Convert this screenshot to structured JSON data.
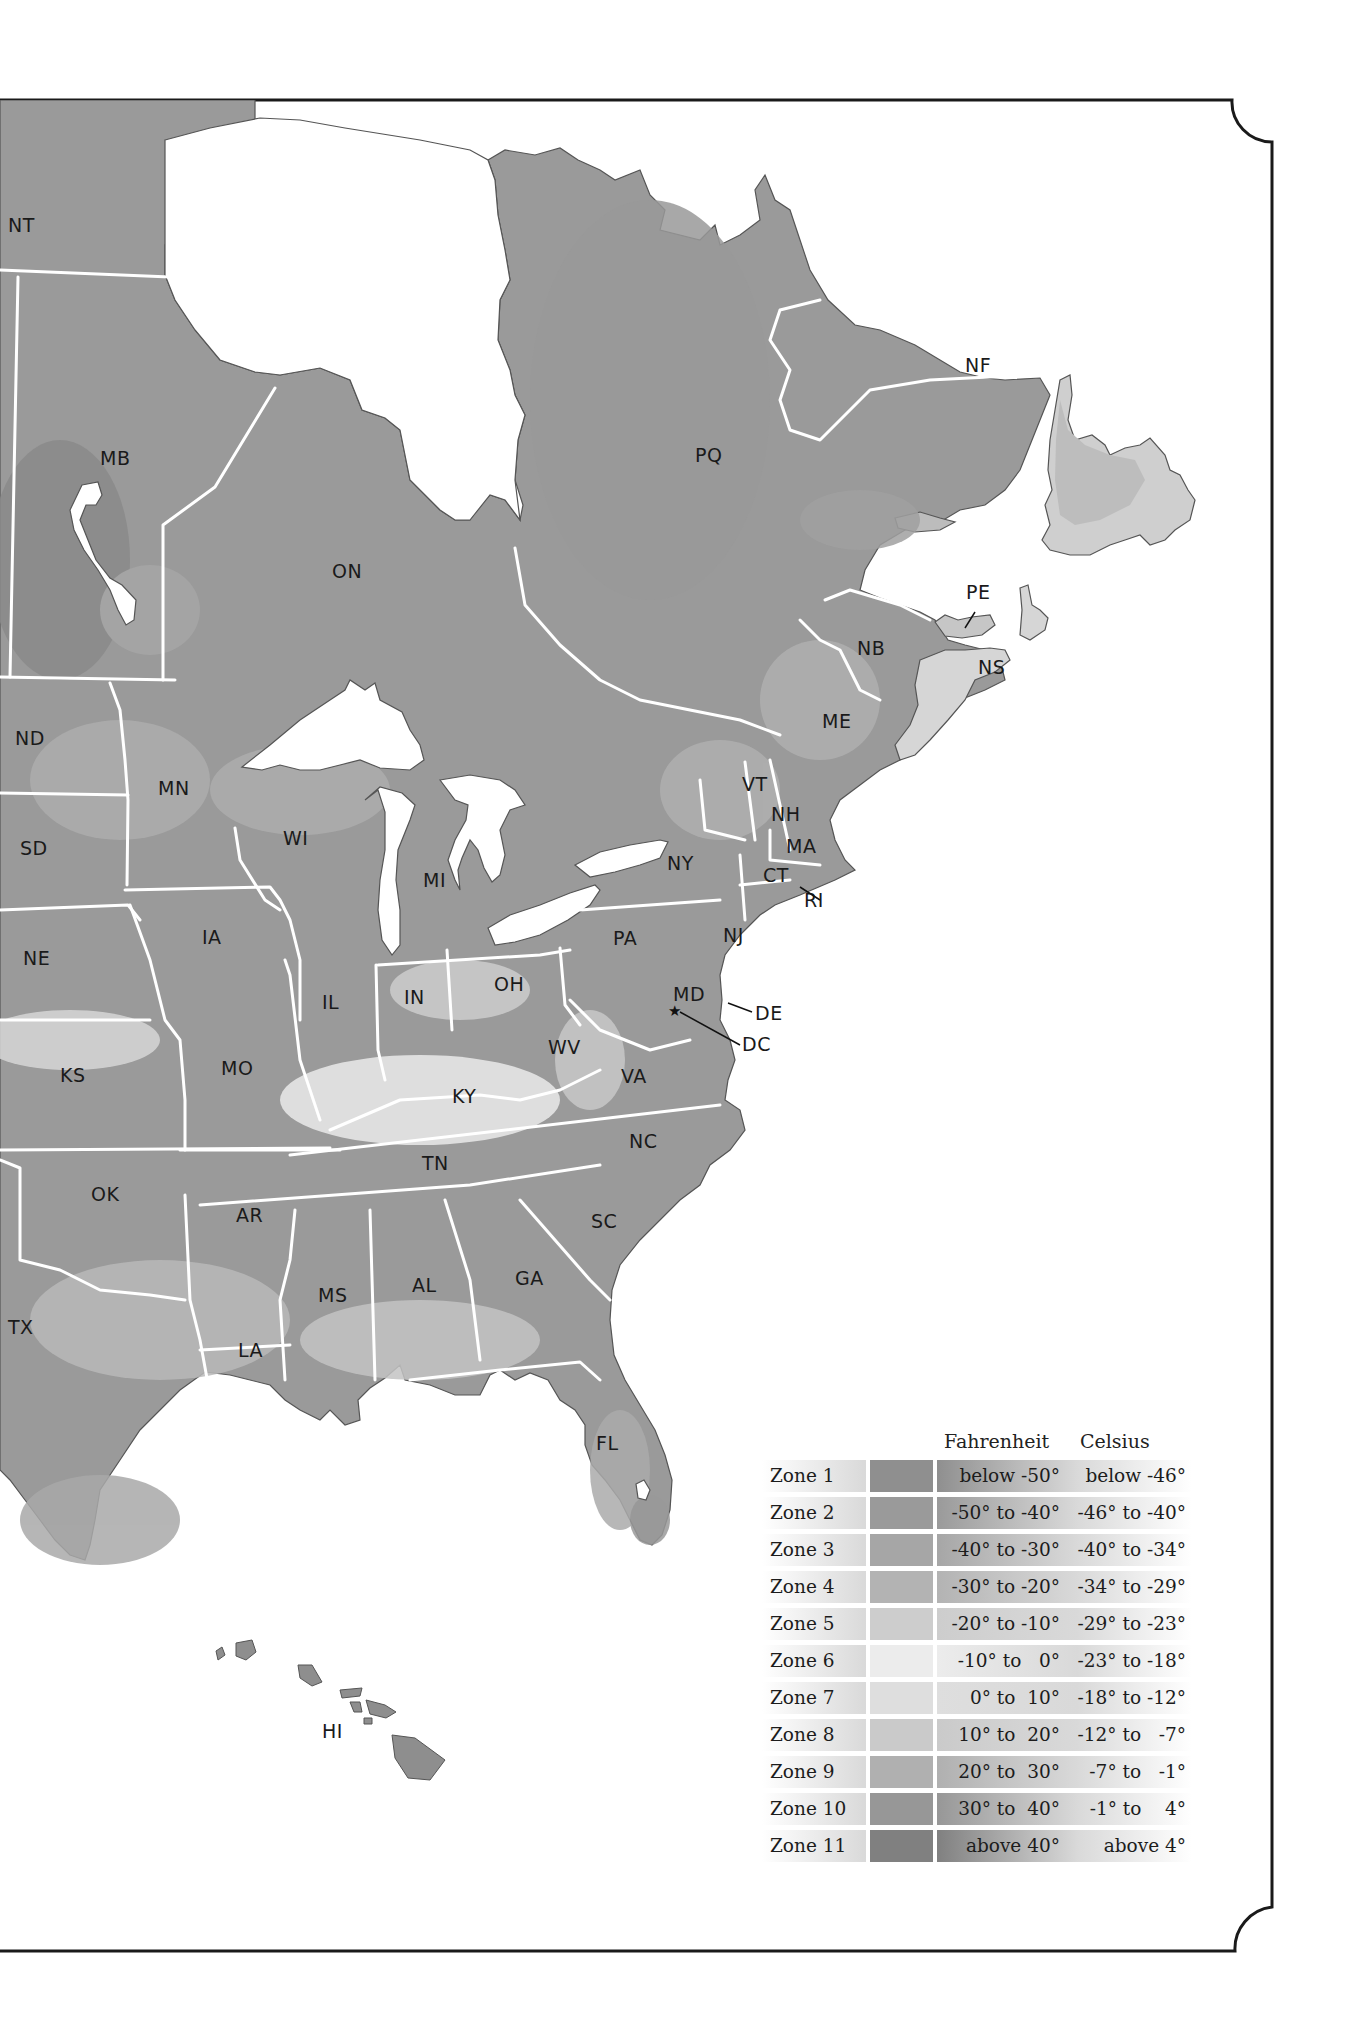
{
  "map": {
    "title": "Plant Hardiness Zones — Eastern North America",
    "canada_labels": [
      {
        "code": "NT",
        "x": 8,
        "y": 232
      },
      {
        "code": "MB",
        "x": 100,
        "y": 465
      },
      {
        "code": "ON",
        "x": 332,
        "y": 578
      },
      {
        "code": "PQ",
        "x": 695,
        "y": 462
      },
      {
        "code": "NF",
        "x": 965,
        "y": 372
      },
      {
        "code": "PE",
        "x": 966,
        "y": 599
      },
      {
        "code": "NB",
        "x": 857,
        "y": 655
      },
      {
        "code": "NS",
        "x": 978,
        "y": 674
      },
      {
        "code": "ME",
        "x": 822,
        "y": 728
      }
    ],
    "us_labels": [
      {
        "code": "ND",
        "x": 15,
        "y": 745
      },
      {
        "code": "MN",
        "x": 158,
        "y": 795
      },
      {
        "code": "WI",
        "x": 283,
        "y": 845
      },
      {
        "code": "SD",
        "x": 20,
        "y": 855
      },
      {
        "code": "MI",
        "x": 423,
        "y": 887
      },
      {
        "code": "VT",
        "x": 742,
        "y": 791
      },
      {
        "code": "NH",
        "x": 771,
        "y": 821
      },
      {
        "code": "MA",
        "x": 786,
        "y": 853
      },
      {
        "code": "NY",
        "x": 667,
        "y": 870
      },
      {
        "code": "CT",
        "x": 763,
        "y": 882
      },
      {
        "code": "RI",
        "x": 804,
        "y": 907
      },
      {
        "code": "NE",
        "x": 23,
        "y": 965
      },
      {
        "code": "IA",
        "x": 202,
        "y": 944
      },
      {
        "code": "PA",
        "x": 613,
        "y": 945
      },
      {
        "code": "NJ",
        "x": 723,
        "y": 942
      },
      {
        "code": "IL",
        "x": 322,
        "y": 1009
      },
      {
        "code": "IN",
        "x": 404,
        "y": 1004
      },
      {
        "code": "OH",
        "x": 494,
        "y": 991
      },
      {
        "code": "MD",
        "x": 673,
        "y": 1001
      },
      {
        "code": "DE",
        "x": 755,
        "y": 1020
      },
      {
        "code": "DC",
        "x": 742,
        "y": 1051
      },
      {
        "code": "WV",
        "x": 548,
        "y": 1054
      },
      {
        "code": "KS",
        "x": 60,
        "y": 1082
      },
      {
        "code": "MO",
        "x": 221,
        "y": 1075
      },
      {
        "code": "VA",
        "x": 621,
        "y": 1083
      },
      {
        "code": "KY",
        "x": 452,
        "y": 1103
      },
      {
        "code": "NC",
        "x": 629,
        "y": 1148
      },
      {
        "code": "TN",
        "x": 422,
        "y": 1170
      },
      {
        "code": "OK",
        "x": 91,
        "y": 1201
      },
      {
        "code": "AR",
        "x": 236,
        "y": 1222
      },
      {
        "code": "SC",
        "x": 591,
        "y": 1228
      },
      {
        "code": "GA",
        "x": 515,
        "y": 1285
      },
      {
        "code": "AL",
        "x": 412,
        "y": 1292
      },
      {
        "code": "MS",
        "x": 318,
        "y": 1302
      },
      {
        "code": "TX",
        "x": 8,
        "y": 1334
      },
      {
        "code": "LA",
        "x": 238,
        "y": 1357
      },
      {
        "code": "FL",
        "x": 596,
        "y": 1450
      },
      {
        "code": "HI",
        "x": 322,
        "y": 1738
      }
    ],
    "capital_marker": {
      "icon": "star-icon",
      "glyph": "★",
      "label": "DC"
    }
  },
  "legend": {
    "header_fahrenheit": "Fahrenheit",
    "header_celsius": "Celsius",
    "zones": [
      {
        "zone": "Zone 1",
        "fahrenheit": "below -50°",
        "celsius": "below -46°",
        "color": "#8f8f8f"
      },
      {
        "zone": "Zone 2",
        "fahrenheit": "-50° to -40°",
        "celsius": "-46° to -40°",
        "color": "#9a9a9a"
      },
      {
        "zone": "Zone 3",
        "fahrenheit": "-40° to -30°",
        "celsius": "-40° to -34°",
        "color": "#a6a6a6"
      },
      {
        "zone": "Zone 4",
        "fahrenheit": "-30° to -20°",
        "celsius": "-34° to -29°",
        "color": "#b3b3b3"
      },
      {
        "zone": "Zone 5",
        "fahrenheit": "-20° to -10°",
        "celsius": "-29° to -23°",
        "color": "#cdcdcd"
      },
      {
        "zone": "Zone 6",
        "fahrenheit": "-10° to   0°",
        "celsius": "-23° to -18°",
        "color": "#ececec"
      },
      {
        "zone": "Zone 7",
        "fahrenheit": "0° to  10°",
        "celsius": "-18° to -12°",
        "color": "#dedede"
      },
      {
        "zone": "Zone 8",
        "fahrenheit": "10° to  20°",
        "celsius": "-12° to   -7°",
        "color": "#cacaca"
      },
      {
        "zone": "Zone 9",
        "fahrenheit": "20° to  30°",
        "celsius": "-7° to   -1°",
        "color": "#b0b0b0"
      },
      {
        "zone": "Zone 10",
        "fahrenheit": "30° to  40°",
        "celsius": "-1° to    4°",
        "color": "#979797"
      },
      {
        "zone": "Zone 11",
        "fahrenheit": "above 40°",
        "celsius": "above 4°",
        "color": "#808080"
      }
    ]
  },
  "colors": {
    "frame": "#1a1a1a",
    "border": "#ffffff",
    "water": "#ffffff",
    "label": "#1a1a1a"
  }
}
